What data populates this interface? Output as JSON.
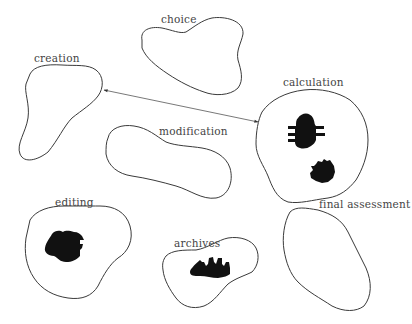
{
  "diagram": {
    "type": "region-map",
    "regions": [
      {
        "id": "choice",
        "label": "choice",
        "contains_artifacts": 0
      },
      {
        "id": "creation",
        "label": "creation",
        "contains_artifacts": 0
      },
      {
        "id": "calculation",
        "label": "calculation",
        "contains_artifacts": 2
      },
      {
        "id": "modification",
        "label": "modification",
        "contains_artifacts": 0
      },
      {
        "id": "editing",
        "label": "editing",
        "contains_artifacts": 1
      },
      {
        "id": "archives",
        "label": "archives",
        "contains_artifacts": 1
      },
      {
        "id": "final-assessment",
        "label": "final assessment",
        "contains_artifacts": 0
      }
    ],
    "connections": [
      {
        "from": "creation",
        "to": "calculation",
        "style": "double-headed-arrow"
      }
    ],
    "colors": {
      "outline": "#3a3a3a",
      "artifact": "#111111",
      "label": "#444444",
      "background": "#ffffff"
    }
  }
}
